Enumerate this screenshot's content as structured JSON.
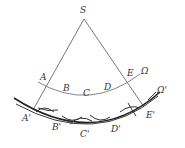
{
  "diagram": {
    "type": "geometry-construction",
    "points": {
      "S": {
        "label": "S"
      },
      "A": {
        "label": "A"
      },
      "B": {
        "label": "B"
      },
      "C": {
        "label": "C"
      },
      "D": {
        "label": "D"
      },
      "E": {
        "label": "E"
      },
      "A_prime": {
        "label": "A'"
      },
      "B_prime": {
        "label": "B'"
      },
      "C_prime": {
        "label": "C'"
      },
      "D_prime": {
        "label": "D'"
      },
      "E_prime": {
        "label": "E'"
      }
    },
    "curves": {
      "omega": {
        "label": "Ω"
      },
      "omega_prime": {
        "label": "Ω'"
      }
    },
    "colors": {
      "lines": "#555555",
      "omega_arc": "#777777",
      "omega_prime_arc": "#222222",
      "text": "#333333"
    }
  }
}
